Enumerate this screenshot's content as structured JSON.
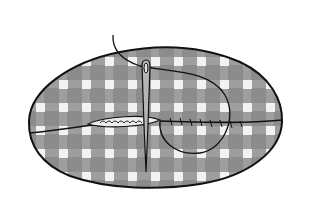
{
  "illustration": {
    "subject": "pinked fabric swatch with gingham oval pillow being sewn shut with needle and thread",
    "colors": {
      "page_bg": "#ffffff",
      "swatch": "#c9c9c9",
      "pillow": "#8c8c8c",
      "check_light": "#f2f2f2",
      "check_mid": "#a8a8a8",
      "outline": "#111111",
      "opening": "#e8e8e8"
    },
    "swatch": {
      "x": 14,
      "y": 8,
      "width": 288,
      "height": 207,
      "zigzag_size": 8
    },
    "pillow": {
      "cx": 156,
      "cy": 115,
      "rx": 128,
      "ry": 71
    },
    "needle": {
      "x": 146,
      "top": 58,
      "bottom": 172
    },
    "seam_opening": {
      "x1": 88,
      "x2": 160,
      "y": 123
    }
  }
}
